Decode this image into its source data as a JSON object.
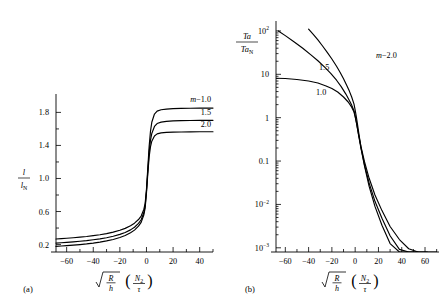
{
  "figure": {
    "background": "#ffffff",
    "ink": "#000000",
    "panels": [
      {
        "tag": "(a)",
        "x_axis": {
          "label_parts": {
            "radical": "√",
            "num1": "R",
            "den1": "h",
            "num2": "N",
            "num2_sub": "2",
            "den2": "τ"
          },
          "ticks": [
            -60,
            -40,
            -20,
            0,
            20,
            40
          ],
          "tick_labels": [
            "−60",
            "−40",
            "−20",
            "0",
            "20",
            "40"
          ],
          "minor_step": 10,
          "range": [
            -68,
            50
          ]
        },
        "y_axis": {
          "label_num": "l",
          "label_den": "l",
          "label_den_sub": "N",
          "ticks": [
            0.2,
            0.6,
            1.0,
            1.4,
            1.8
          ],
          "tick_labels": [
            "0.2",
            "0.6",
            "1.0",
            "1.4",
            "1.8"
          ],
          "minor_step": 0.2,
          "range": [
            0.11,
            1.95
          ]
        },
        "curve_labels": [
          {
            "text": "m = 1.0",
            "m": 1.0,
            "italic_lead": "m",
            "rest": "−1.0"
          },
          {
            "text": "1.5",
            "m": 1.5
          },
          {
            "text": "2.0",
            "m": 2.0
          }
        ]
      },
      {
        "tag": "(b)",
        "x_axis": {
          "label_parts": {
            "radical": "√",
            "num1": "R",
            "den1": "h",
            "num2": "N",
            "num2_sub": "2",
            "den2": "τ"
          },
          "ticks": [
            -60,
            -40,
            -20,
            0,
            20,
            40,
            60
          ],
          "tick_labels": [
            "−60",
            "−40",
            "−20",
            "0",
            "20",
            "40",
            "60"
          ],
          "minor_step": 10,
          "range": [
            -68,
            72
          ]
        },
        "y_axis": {
          "label_num": "Ta",
          "label_den": "Ta",
          "label_den_sub": "N",
          "scale": "log",
          "ticks": [
            100,
            10,
            1,
            0.1,
            0.01,
            0.001
          ],
          "tick_labels": [
            "10",
            "10",
            "1",
            "0.1",
            "10",
            "10"
          ],
          "tick_label_sups": [
            "2",
            "",
            "",
            "",
            "−2",
            "−3"
          ],
          "range": [
            0.0008,
            130
          ]
        },
        "curve_labels": [
          {
            "text": "m = 2.0",
            "m": 2.0,
            "italic_lead": "m",
            "rest": "−2.0"
          },
          {
            "text": "1.5",
            "m": 1.5
          },
          {
            "text": "1.0",
            "m": 1.0
          }
        ]
      }
    ]
  },
  "chart_data": [
    {
      "type": "line",
      "panel": "(a)",
      "title": "",
      "xlabel": "sqrt(R/h) (N2/tau)",
      "ylabel": "l / l_N",
      "xlim": [
        -68,
        50
      ],
      "ylim": [
        0.11,
        1.95
      ],
      "yscale": "linear",
      "grid": false,
      "legend": "inline-curve-labels",
      "x": [
        -68,
        -64,
        -60,
        -55,
        -50,
        -45,
        -40,
        -35,
        -30,
        -25,
        -20,
        -16,
        -12,
        -9,
        -6,
        -4,
        -2,
        -1,
        0,
        1,
        2,
        3,
        4,
        6,
        8,
        11,
        15,
        20,
        26,
        33,
        40,
        50
      ],
      "series": [
        {
          "name": "m = 1.0",
          "m": 1.0,
          "values": [
            0.268,
            0.272,
            0.277,
            0.283,
            0.29,
            0.298,
            0.308,
            0.319,
            0.333,
            0.35,
            0.373,
            0.396,
            0.428,
            0.459,
            0.503,
            0.545,
            0.625,
            0.7,
            0.87,
            1.13,
            1.39,
            1.57,
            1.68,
            1.78,
            1.815,
            1.832,
            1.84,
            1.845,
            1.848,
            1.85,
            1.851,
            1.852
          ]
        },
        {
          "name": "m = 1.5",
          "m": 1.5,
          "values": [
            0.218,
            0.222,
            0.227,
            0.233,
            0.24,
            0.248,
            0.258,
            0.269,
            0.283,
            0.3,
            0.323,
            0.346,
            0.378,
            0.41,
            0.456,
            0.5,
            0.585,
            0.665,
            0.845,
            1.09,
            1.32,
            1.46,
            1.545,
            1.63,
            1.665,
            1.682,
            1.692,
            1.697,
            1.7,
            1.702,
            1.703,
            1.704
          ]
        },
        {
          "name": "m = 2.0",
          "m": 2.0,
          "values": [
            0.178,
            0.182,
            0.187,
            0.193,
            0.2,
            0.208,
            0.218,
            0.23,
            0.244,
            0.262,
            0.285,
            0.309,
            0.342,
            0.375,
            0.423,
            0.469,
            0.557,
            0.64,
            0.825,
            1.058,
            1.262,
            1.382,
            1.452,
            1.515,
            1.54,
            1.552,
            1.558,
            1.561,
            1.563,
            1.564,
            1.565,
            1.566
          ]
        }
      ]
    },
    {
      "type": "line",
      "panel": "(b)",
      "title": "",
      "xlabel": "sqrt(R/h) (N2/tau)",
      "ylabel": "Ta / Ta_N",
      "xlim": [
        -68,
        72
      ],
      "ylim": [
        0.0008,
        130
      ],
      "yscale": "log",
      "grid": false,
      "legend": "inline-curve-labels",
      "series": [
        {
          "name": "m = 1.0",
          "m": 1.0,
          "x": [
            -68,
            -60,
            -50,
            -40,
            -32,
            -25,
            -20,
            -15,
            -10,
            -6,
            -3,
            -1,
            0,
            1,
            2,
            3,
            5,
            8,
            12,
            17,
            23,
            30,
            38,
            46,
            54,
            62,
            70
          ],
          "values": [
            8.1,
            8.0,
            7.6,
            7.0,
            6.3,
            5.4,
            4.7,
            3.9,
            3.0,
            2.3,
            1.75,
            1.35,
            1.05,
            0.78,
            0.56,
            0.4,
            0.215,
            0.097,
            0.04,
            0.0165,
            0.0072,
            0.0031,
            0.00155,
            0.00095,
            0.00072,
            0.00062,
            0.00058
          ]
        },
        {
          "name": "m = 1.5",
          "m": 1.5,
          "x": [
            -66,
            -60,
            -52,
            -45,
            -38,
            -32,
            -26,
            -21,
            -16,
            -12,
            -8,
            -5,
            -3,
            -1,
            0,
            1,
            2,
            3,
            5,
            8,
            12,
            17,
            23,
            30,
            38,
            46,
            54,
            62
          ],
          "values": [
            100,
            78,
            55,
            40,
            28,
            20.5,
            14.5,
            10.5,
            7.3,
            5.2,
            3.5,
            2.5,
            1.95,
            1.45,
            1.1,
            0.8,
            0.56,
            0.385,
            0.195,
            0.082,
            0.031,
            0.0118,
            0.0048,
            0.0019,
            0.00092,
            0.00058,
            0.00046,
            0.00042
          ]
        },
        {
          "name": "m = 2.0",
          "m": 2.0,
          "x": [
            -40,
            -36,
            -32,
            -28,
            -24,
            -20,
            -16,
            -13,
            -10,
            -7,
            -5,
            -3,
            -1,
            0,
            1,
            2,
            3,
            5,
            8,
            12,
            17,
            23,
            30,
            38,
            46,
            54
          ],
          "values": [
            110,
            83,
            62,
            45,
            32,
            22.5,
            15.3,
            11.2,
            7.9,
            5.4,
            4.1,
            3.0,
            2.05,
            1.5,
            1.05,
            0.7,
            0.46,
            0.205,
            0.077,
            0.026,
            0.009,
            0.0033,
            0.00125,
            0.00062,
            0.00043,
            0.00038
          ]
        }
      ]
    }
  ]
}
